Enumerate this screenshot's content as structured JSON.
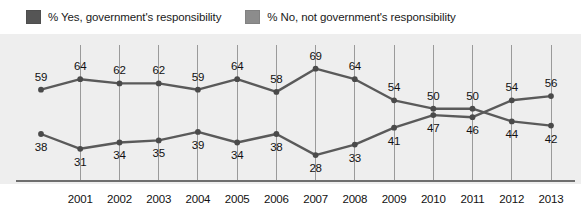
{
  "legend": {
    "items": [
      {
        "label": "% Yes, government's responsibility",
        "color": "#555555",
        "key": "yes"
      },
      {
        "label": "% No, not government's responsibility",
        "color": "#8c8c8c",
        "key": "no"
      }
    ]
  },
  "chart_data": {
    "type": "line",
    "title": "",
    "xlabel": "",
    "ylabel": "",
    "grid": true,
    "legend_position": "top-left",
    "ylim": [
      20,
      75
    ],
    "x": [
      "",
      "2001",
      "2002",
      "2003",
      "2004",
      "2005",
      "2006",
      "2007",
      "2008",
      "2009",
      "2010",
      "2011",
      "2012",
      "2013"
    ],
    "tick_labels": [
      "2001",
      "2002",
      "2003",
      "2004",
      "2005",
      "2006",
      "2007",
      "2008",
      "2009",
      "2010",
      "2011",
      "2012",
      "2013"
    ],
    "series": [
      {
        "name": "% Yes, government's responsibility",
        "color": "#555555",
        "values": [
          59,
          64,
          62,
          62,
          59,
          64,
          58,
          69,
          64,
          54,
          50,
          50,
          44,
          42
        ]
      },
      {
        "name": "% No, not government's responsibility",
        "color": "#5f5f5f",
        "values": [
          38,
          31,
          34,
          35,
          39,
          34,
          38,
          28,
          33,
          41,
          47,
          46,
          54,
          56
        ]
      }
    ]
  },
  "style": {
    "plot_background": "#eeeeee",
    "gridline_color": "#9a9a9a",
    "axis_color": "#6e6e6e",
    "line_color": "#5a5a5a",
    "marker_color": "#4a4a4a",
    "label_color": "#111111"
  }
}
